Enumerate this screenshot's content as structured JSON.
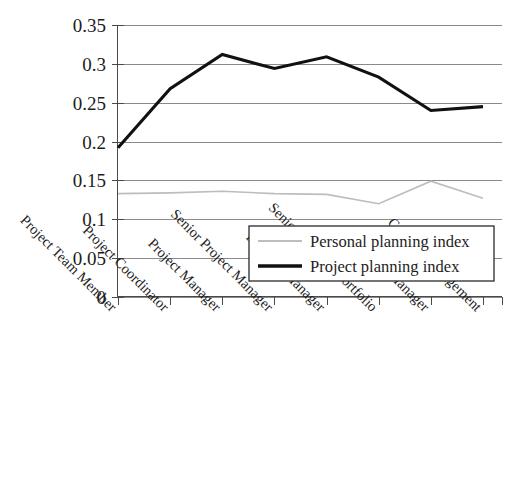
{
  "chart_data": {
    "type": "line",
    "title": "",
    "subtitle": "",
    "xlabel": "",
    "ylabel": "",
    "ylim": [
      0,
      0.35
    ],
    "ytick_labels": [
      "0.35",
      "0.3",
      "0.25",
      "0.2",
      "0.15",
      "0.1",
      "0.05",
      "0"
    ],
    "ytick_values": [
      0.35,
      0.3,
      0.25,
      0.2,
      0.15,
      0.1,
      0.05,
      0
    ],
    "grid": true,
    "legend_position": "inside-bottom-right",
    "categories": [
      "Project Team Member",
      "Project Coordinator",
      "Project Manager",
      "Senior Project Manager",
      "Program Manager",
      "Senior Program/Portfolio",
      "Senior Manager",
      "C Level Management"
    ],
    "series": [
      {
        "name": "Personal planning index",
        "color": "#bdbdbd",
        "values": [
          0.133,
          0.134,
          0.136,
          0.133,
          0.132,
          0.12,
          0.149,
          0.127
        ]
      },
      {
        "name": "Project planning index",
        "color": "#111111",
        "values": [
          0.192,
          0.268,
          0.312,
          0.294,
          0.309,
          0.283,
          0.24,
          0.245
        ]
      }
    ]
  },
  "legend": {
    "entries": [
      {
        "label": "Personal planning index"
      },
      {
        "label": "Project planning index"
      }
    ]
  }
}
